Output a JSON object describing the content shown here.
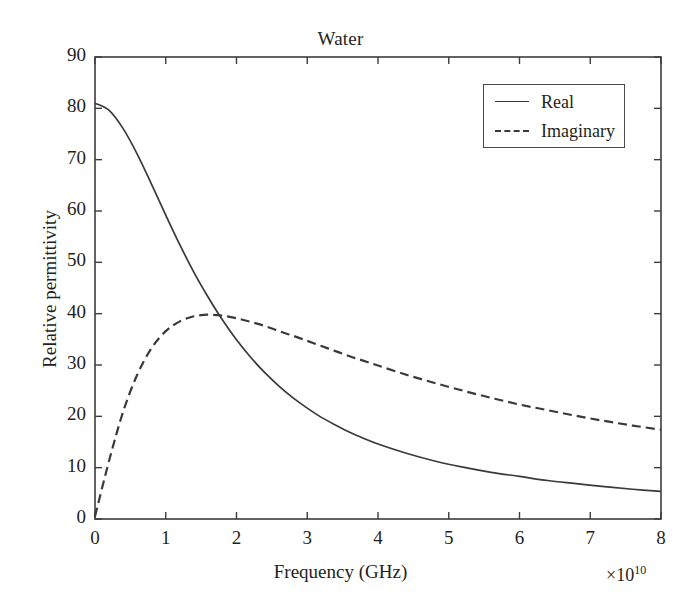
{
  "chart_data": {
    "type": "line",
    "title": "Water",
    "xlabel": "Frequency (GHz)",
    "ylabel": "Relative permittivity",
    "x_exponent_prefix": "×10",
    "x_exponent_power": "10",
    "xlim": [
      0,
      8
    ],
    "ylim": [
      0,
      90
    ],
    "xticks": [
      0,
      1,
      2,
      3,
      4,
      5,
      6,
      7,
      8
    ],
    "xtick_labels": [
      "0",
      "1",
      "2",
      "3",
      "4",
      "5",
      "6",
      "7",
      "8"
    ],
    "yticks": [
      0,
      10,
      20,
      30,
      40,
      50,
      60,
      70,
      80,
      90
    ],
    "ytick_labels": [
      "0",
      "10",
      "20",
      "30",
      "40",
      "50",
      "60",
      "70",
      "80",
      "90"
    ],
    "grid": false,
    "legend_position": "upper right",
    "legend_entries": [
      "Real",
      "Imaginary"
    ],
    "x": [
      0.0,
      0.2,
      0.4,
      0.6,
      0.8,
      1.0,
      1.2,
      1.4,
      1.6,
      1.8,
      2.0,
      2.2,
      2.4,
      2.6,
      2.8,
      3.0,
      3.2,
      3.4,
      3.6,
      3.8,
      4.0,
      4.4,
      4.8,
      5.2,
      5.6,
      6.0,
      6.4,
      6.8,
      7.2,
      7.6,
      8.0
    ],
    "series": [
      {
        "name": "Real",
        "style": "solid",
        "color": "#3a3a3a",
        "values": [
          81.0,
          79.6,
          76.0,
          71.0,
          65.2,
          59.2,
          53.4,
          48.0,
          43.2,
          38.8,
          34.9,
          31.5,
          28.5,
          25.9,
          23.6,
          21.6,
          19.8,
          18.3,
          16.9,
          15.7,
          14.6,
          12.8,
          11.3,
          10.1,
          9.1,
          8.3,
          7.5,
          6.9,
          6.3,
          5.8,
          5.4
        ]
      },
      {
        "name": "Imaginary",
        "style": "dashed",
        "color": "#3a3a3a",
        "values": [
          0.5,
          11.4,
          21.0,
          28.2,
          33.3,
          36.6,
          38.5,
          39.5,
          39.8,
          39.6,
          39.1,
          38.4,
          37.6,
          36.6,
          35.7,
          34.7,
          33.7,
          32.7,
          31.7,
          30.8,
          29.9,
          28.1,
          26.5,
          25.0,
          23.6,
          22.3,
          21.2,
          20.1,
          19.1,
          18.2,
          17.4
        ]
      }
    ]
  }
}
